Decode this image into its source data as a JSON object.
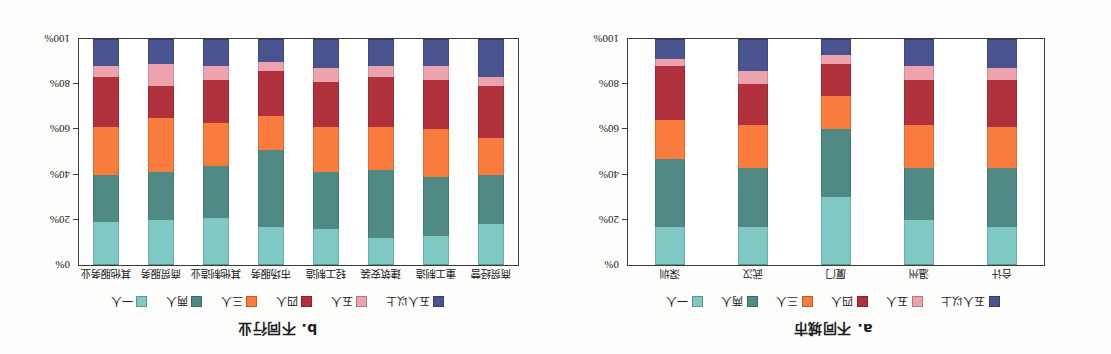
{
  "figure": {
    "background": "#fdfdfc",
    "orientation_note": "180"
  },
  "legend_series": [
    {
      "label": "一人",
      "color": "#7fc8c4"
    },
    {
      "label": "两人",
      "color": "#4f8b84"
    },
    {
      "label": "三人",
      "color": "#f97b3d"
    },
    {
      "label": "四人",
      "color": "#b0303c"
    },
    {
      "label": "五人",
      "color": "#eda3ad"
    },
    {
      "label": "五人以上",
      "color": "#49538f"
    }
  ],
  "yaxis": {
    "ticks": [
      "0%",
      "20%",
      "40%",
      "60%",
      "80%",
      "100%"
    ],
    "values": [
      0,
      20,
      40,
      60,
      80,
      100
    ],
    "min": 0,
    "max": 100
  },
  "panel_a": {
    "title": "a. 不同城市",
    "chart_data": {
      "type": "bar",
      "stacked": true,
      "normalized_percent": true,
      "title": "a. 不同城市",
      "xlabel": "",
      "ylabel": "",
      "ylim": [
        0,
        100
      ],
      "grid": false,
      "legend_position": "top",
      "categories": [
        "合计",
        "温州",
        "厦门",
        "武汉",
        "深圳"
      ],
      "series": [
        {
          "name": "一人",
          "color": "#7fc8c4",
          "values": [
            17,
            20,
            30,
            17,
            17
          ]
        },
        {
          "name": "两人",
          "color": "#4f8b84",
          "values": [
            26,
            23,
            30,
            26,
            30
          ]
        },
        {
          "name": "三人",
          "color": "#f97b3d",
          "values": [
            18,
            19,
            15,
            19,
            17
          ]
        },
        {
          "name": "四人",
          "color": "#b0303c",
          "values": [
            21,
            20,
            14,
            18,
            24
          ]
        },
        {
          "name": "五人",
          "color": "#eda3ad",
          "values": [
            5,
            6,
            4,
            6,
            3
          ]
        },
        {
          "name": "五人以上",
          "color": "#49538f",
          "values": [
            13,
            12,
            7,
            14,
            9
          ]
        }
      ]
    }
  },
  "panel_b": {
    "title": "b. 不同行业",
    "chart_data": {
      "type": "bar",
      "stacked": true,
      "normalized_percent": true,
      "title": "b. 不同行业",
      "xlabel": "",
      "ylabel": "",
      "ylim": [
        0,
        100
      ],
      "grid": false,
      "legend_position": "top",
      "categories": [
        "商贸经营",
        "重工制造",
        "建筑安装",
        "轻工制造",
        "市场服务",
        "其他制造业",
        "商贸服务",
        "其他服务业"
      ],
      "series": [
        {
          "name": "一人",
          "color": "#7fc8c4",
          "values": [
            18,
            13,
            12,
            16,
            17,
            21,
            20,
            19
          ]
        },
        {
          "name": "两人",
          "color": "#4f8b84",
          "values": [
            22,
            26,
            30,
            25,
            34,
            23,
            21,
            21
          ]
        },
        {
          "name": "三人",
          "color": "#f97b3d",
          "values": [
            16,
            21,
            19,
            20,
            15,
            19,
            24,
            21
          ]
        },
        {
          "name": "四人",
          "color": "#b0303c",
          "values": [
            23,
            22,
            22,
            20,
            20,
            19,
            14,
            22
          ]
        },
        {
          "name": "五人",
          "color": "#eda3ad",
          "values": [
            4,
            6,
            5,
            6,
            4,
            6,
            10,
            5
          ]
        },
        {
          "name": "五人以上",
          "color": "#49538f",
          "values": [
            17,
            12,
            12,
            13,
            10,
            12,
            11,
            12
          ]
        }
      ]
    }
  }
}
